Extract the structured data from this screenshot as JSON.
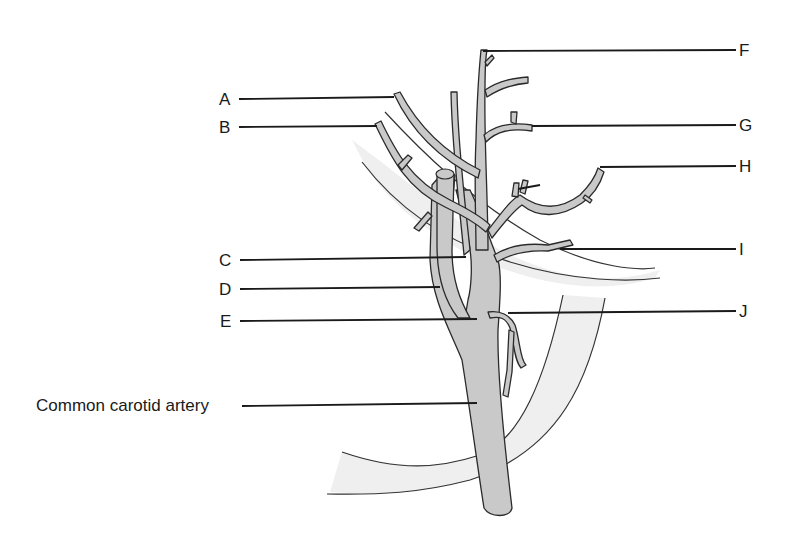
{
  "diagram": {
    "colors": {
      "vessel_fill": "#c9c9c9",
      "vessel_outline": "#2a2a2a",
      "tissue_fill": "#efefef",
      "leader_line": "#1a1a1a"
    },
    "labels": {
      "A": "A",
      "B": "B",
      "C": "C",
      "D": "D",
      "E": "E",
      "F": "F",
      "G": "G",
      "H": "H",
      "I": "I",
      "J": "J",
      "common_carotid": "Common carotid artery"
    }
  }
}
